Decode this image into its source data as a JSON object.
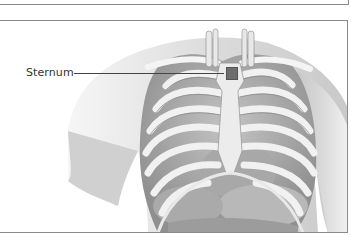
{
  "figure": {
    "labels": [
      {
        "text": "Sternum",
        "target": "sternum",
        "marker_color": "#6e6e6e"
      }
    ]
  },
  "colors": {
    "frame_border": "#8a8a8a",
    "label_text": "#333333",
    "leader_line": "#444444",
    "skin": "#e9e9e9",
    "bone": "#f2f2f2",
    "shadow": "#9a9a9a"
  }
}
